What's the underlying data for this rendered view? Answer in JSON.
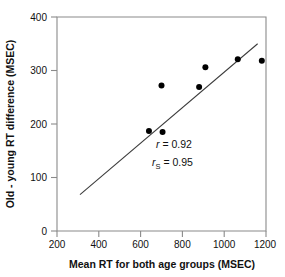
{
  "chart_data": {
    "type": "scatter",
    "title": "",
    "xlabel": "Mean RT for both age groups (MSEC)",
    "ylabel": "Old - young RT difference (MSEC)",
    "xlim": [
      200,
      1200
    ],
    "ylim": [
      0,
      400
    ],
    "xticks": [
      200,
      400,
      600,
      800,
      1000,
      1200
    ],
    "yticks": [
      0,
      100,
      200,
      300,
      400
    ],
    "xtick_labels": [
      "200",
      "400",
      "600",
      "800",
      "1000",
      "1200"
    ],
    "ytick_labels": [
      "0",
      "100",
      "200",
      "300",
      "400"
    ],
    "grid": false,
    "legend": "none",
    "marker": "filled-circle",
    "marker_color": "#000000",
    "points": [
      {
        "x": 640,
        "y": 187
      },
      {
        "x": 705,
        "y": 185
      },
      {
        "x": 700,
        "y": 272
      },
      {
        "x": 880,
        "y": 269
      },
      {
        "x": 910,
        "y": 306
      },
      {
        "x": 1065,
        "y": 321
      },
      {
        "x": 1180,
        "y": 318
      }
    ],
    "fit_line": {
      "type": "linear-regression",
      "x_start": 310,
      "y_start": 68,
      "x_end": 1160,
      "y_end": 350,
      "color": "#3a3a3a"
    },
    "annotations": [
      {
        "name": "pearson-r",
        "symbol": "r",
        "subscript": "",
        "equals": " = ",
        "value": "0.92"
      },
      {
        "name": "spearman-rs",
        "symbol": "r",
        "subscript": "S",
        "equals": " = ",
        "value": "0.95"
      }
    ]
  },
  "figure": {
    "background": "#ffffff",
    "axis_color": "#8a8a8a",
    "text_color": "#111111"
  }
}
